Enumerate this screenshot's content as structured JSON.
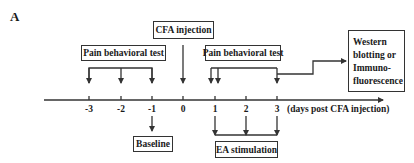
{
  "panel_label": "A",
  "boxes": {
    "cfa_injection": "CFA injection",
    "pain_test_pre": "Pain behavioral test",
    "pain_test_post": "Pain behavioral test",
    "western_lines": [
      "Western",
      "blotting or",
      "Immuno-",
      "fluorescence"
    ],
    "baseline": "Baseline",
    "ea_stimulation": "EA stimulation"
  },
  "axis": {
    "ticks": [
      "-3",
      "-2",
      "-1",
      "0",
      "1",
      "2",
      "3"
    ],
    "caption": "(days post CFA injection)"
  },
  "colors": {
    "line": "#333333",
    "text": "#1a1a1a"
  }
}
